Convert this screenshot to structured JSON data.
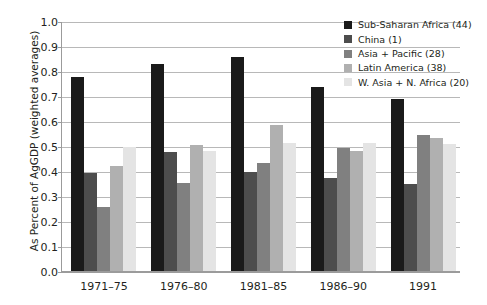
{
  "chart_data": {
    "type": "bar",
    "title": "",
    "xlabel": "",
    "ylabel": "As Percent of AgGDP (weighted averages)",
    "ylim": [
      0.0,
      1.0
    ],
    "ytick_labels": [
      "0.0",
      "0.1",
      "0.2",
      "0.3",
      "0.4",
      "0.5",
      "0.6",
      "0.7",
      "0.8",
      "0.9",
      "1.0"
    ],
    "ytick_values": [
      0.0,
      0.1,
      0.2,
      0.3,
      0.4,
      0.5,
      0.6,
      0.7,
      0.8,
      0.9,
      1.0
    ],
    "grid": true,
    "legend_position": "top-right",
    "categories": [
      "1971–75",
      "1976–80",
      "1981–85",
      "1986–90",
      "1991"
    ],
    "series": [
      {
        "name": "Sub-Saharan Africa (44)",
        "color": "#1a1a1a",
        "values": [
          0.775,
          0.83,
          0.855,
          0.735,
          0.69
        ]
      },
      {
        "name": "China (1)",
        "color": "#4d4d4d",
        "values": [
          0.393,
          0.475,
          0.398,
          0.372,
          0.35
        ]
      },
      {
        "name": "Asia + Pacific (28)",
        "color": "#808080",
        "values": [
          0.255,
          0.352,
          0.432,
          0.492,
          0.545
        ]
      },
      {
        "name": "Latin America (38)",
        "color": "#b0b0b0",
        "values": [
          0.42,
          0.503,
          0.583,
          0.48,
          0.532
        ]
      },
      {
        "name": "W. Asia + N. Africa (20)",
        "color": "#e4e4e4",
        "values": [
          0.495,
          0.482,
          0.512,
          0.512,
          0.51
        ]
      }
    ]
  }
}
